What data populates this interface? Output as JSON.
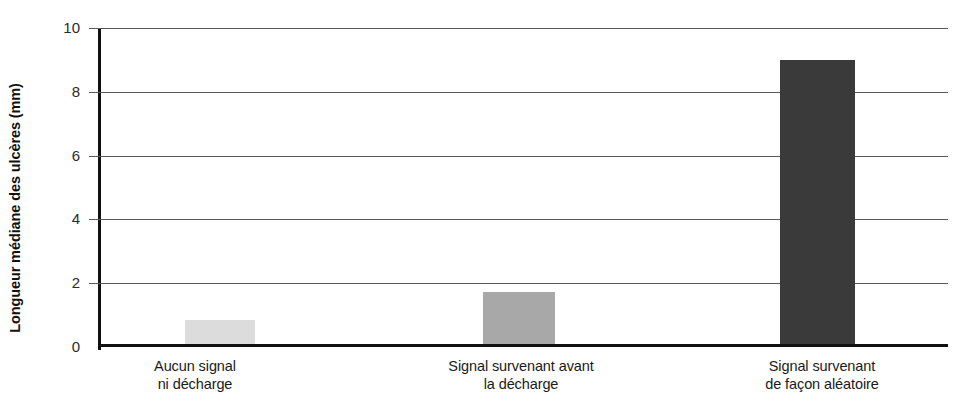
{
  "chart_data": {
    "type": "bar",
    "title": "",
    "xlabel": "",
    "ylabel": "Longueur médiane des ulcères (mm)",
    "categories": [
      "Aucun signal ni décharge",
      "Signal survenant avant la décharge",
      "Signal survenant de façon aléatoire"
    ],
    "category_lines": [
      [
        "Aucun signal",
        "ni décharge"
      ],
      [
        "Signal survenant avant",
        "la décharge"
      ],
      [
        "Signal survenant",
        "de façon aléatoire"
      ]
    ],
    "values": [
      0.75,
      1.65,
      9.0
    ],
    "bar_colors": [
      "#dcdcdc",
      "#a8a8a8",
      "#3a3a3a"
    ],
    "ylim": [
      0,
      10
    ],
    "yticks": [
      0,
      2,
      4,
      6,
      8,
      10
    ],
    "ytick_labels": [
      "0",
      "2",
      "4",
      "6",
      "8",
      "10"
    ],
    "grid": true,
    "grid_axis": "y",
    "legend": false,
    "legend_position": "none",
    "axis_color": "#111111",
    "grid_color": "#585858",
    "background": "#ffffff"
  }
}
